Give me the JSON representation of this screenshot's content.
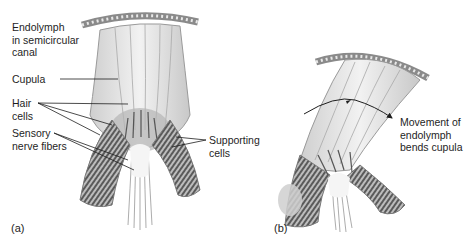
{
  "figure": {
    "panel_a": {
      "letter": "(a)",
      "labels": {
        "endolymph": "Endolymph\nin semicircular\ncanal",
        "cupula": "Cupula",
        "hair_cells": "Hair\ncells",
        "sensory_nerve_fibers": "Sensory\nnerve fibers",
        "supporting_cells": "Supporting\ncells"
      }
    },
    "panel_b": {
      "letter": "(b)",
      "labels": {
        "movement": "Movement of\nendolymph\nbends cupula"
      }
    },
    "colors": {
      "line": "#1e1e1e",
      "tissue_light": "#d9d9d9",
      "tissue_mid": "#9a9a9a",
      "tissue_dark": "#555555"
    }
  }
}
